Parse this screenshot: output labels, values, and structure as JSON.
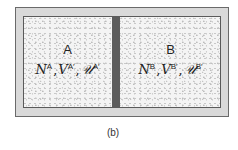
{
  "figure": {
    "caption": "(b)",
    "colors": {
      "frame": "#d9d9d9",
      "frame_border": "#6a6a6a",
      "chamber_fill": "#f4f4f4",
      "wall": "#5c5c5c",
      "text": "#222222"
    },
    "chambers": [
      {
        "label": "A",
        "vars": [
          {
            "symbol": "N",
            "sup": "A"
          },
          {
            "symbol": "V",
            "sup": "A′"
          },
          {
            "symbol": "𝒰",
            "sup": "A′"
          }
        ],
        "separator": ","
      },
      {
        "label": "B",
        "vars": [
          {
            "symbol": "N",
            "sup": "B"
          },
          {
            "symbol": "V",
            "sup": "B′"
          },
          {
            "symbol": "𝒰",
            "sup": "B′"
          }
        ],
        "separator": ","
      }
    ],
    "divider": "wall"
  }
}
